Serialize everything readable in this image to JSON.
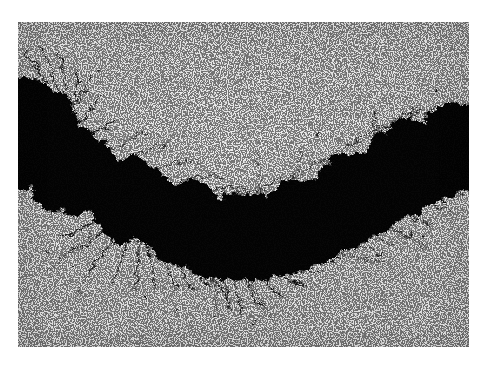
{
  "artwork": {
    "title": "Untitled ink-blot chain",
    "medium": "Black ink on textured paper (photographic reproduction)",
    "orientation": "landscape",
    "canvas": {
      "width": 485,
      "height": 365
    },
    "sheet": {
      "left": 18,
      "top": 22,
      "width": 451,
      "height": 325
    },
    "colors": {
      "outer_margin": "#ffffff",
      "paper": "#f3f3f3",
      "paper_highlight": "#fbfbfb",
      "paper_shadow": "#ededed",
      "ink": "#070707",
      "ink_soft": "#121212"
    },
    "description": "A horizontal chain of large irregular black ink blots sagging in a catenary arc across a lightly textured off-white sheet; fine hair-like ink threads radiate from the blot edges, densest along the lower-left of the curve.",
    "composition_notes": [
      "Heavy black mass bleeds off the left edge between the upper-middle and middle of the sheet.",
      "Eight to nine overlapping round blots descend to a low point just left of centre then climb again.",
      "The chain exits the right edge as a solid black band.",
      "Upper half and lower third of the sheet are empty paper."
    ]
  },
  "blots": [
    {
      "id": "blot-1",
      "cx": 2,
      "cy": 112,
      "r": 54,
      "note": "left edge mass, cropped"
    },
    {
      "id": "blot-2",
      "cx": 52,
      "cy": 148,
      "r": 42
    },
    {
      "id": "blot-3",
      "cx": 112,
      "cy": 178,
      "r": 40
    },
    {
      "id": "blot-4",
      "cx": 168,
      "cy": 202,
      "r": 40
    },
    {
      "id": "blot-5",
      "cx": 224,
      "cy": 212,
      "r": 40
    },
    {
      "id": "blot-6",
      "cx": 281,
      "cy": 196,
      "r": 36
    },
    {
      "id": "blot-7",
      "cx": 336,
      "cy": 172,
      "r": 38
    },
    {
      "id": "blot-8",
      "cx": 392,
      "cy": 138,
      "r": 40
    },
    {
      "id": "blot-9",
      "cx": 447,
      "cy": 122,
      "r": 42,
      "note": "right edge mass, cropped"
    }
  ],
  "arc": {
    "type": "catenary",
    "lowest_point": {
      "x": 224,
      "y": 212
    },
    "left_entry": {
      "x": 0,
      "y": 112
    },
    "right_exit": {
      "x": 451,
      "y": 122
    }
  }
}
